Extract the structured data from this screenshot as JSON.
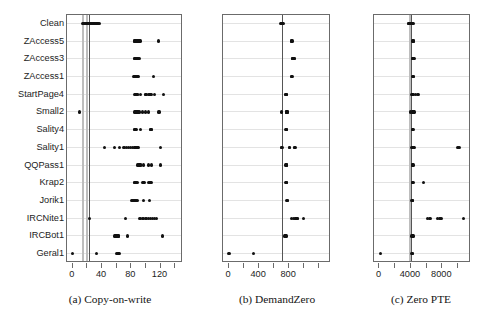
{
  "figure": {
    "type": "multi-panel-strip-plot",
    "panel_count": 3,
    "shared_categories": [
      "Clean",
      "ZAccess5",
      "ZAccess3",
      "ZAccess1",
      "StartPage4",
      "Small2",
      "Sality4",
      "Sality1",
      "QQPass1",
      "Krap2",
      "Jorik1",
      "IRCNite1",
      "IRCBot1",
      "Geral1"
    ],
    "colors": {
      "point": "#111111",
      "box_border": "#6b6b6b",
      "gridline": "#e3e3e3",
      "reference_line_dark": "#555555",
      "reference_line_light": "#bdbdbd",
      "background": "#ffffff"
    }
  },
  "chart_data": [
    {
      "type": "scatter",
      "panel_id": "a",
      "title": "(a) Copy-on-write",
      "caption_prefix": "(a)",
      "caption_name": "Copy-on-write",
      "xlabel": "",
      "ylabel": "",
      "xlim": [
        -8,
        148
      ],
      "grid": true,
      "legend": false,
      "tick_values": [
        0,
        20,
        40,
        60,
        80,
        100,
        120,
        140
      ],
      "tick_labels": [
        "0",
        "",
        "40",
        "",
        "80",
        "",
        "120",
        ""
      ],
      "reference_lines": [
        {
          "value": 13,
          "style": "light"
        },
        {
          "value": 18,
          "style": "light"
        },
        {
          "value": 22,
          "style": "dark"
        }
      ],
      "categories": [
        "Clean",
        "ZAccess5",
        "ZAccess3",
        "ZAccess1",
        "StartPage4",
        "Small2",
        "Sality4",
        "Sality1",
        "QQPass1",
        "Krap2",
        "Jorik1",
        "IRCNite1",
        "IRCBot1",
        "Geral1"
      ],
      "series": [
        {
          "name": "Clean",
          "values": [
            14,
            15,
            16,
            17,
            18,
            19,
            20,
            21,
            22,
            23,
            24,
            25,
            26,
            27,
            28,
            29,
            30,
            31,
            32,
            33,
            34,
            35,
            36
          ]
        },
        {
          "name": "ZAccess5",
          "values": [
            84,
            85,
            86,
            87,
            88,
            89,
            90,
            91,
            92,
            117
          ]
        },
        {
          "name": "ZAccess3",
          "values": [
            84,
            85,
            86,
            87,
            88,
            89,
            90,
            91
          ]
        },
        {
          "name": "ZAccess1",
          "values": [
            83,
            84,
            85,
            86,
            87,
            88,
            89,
            90,
            110
          ]
        },
        {
          "name": "StartPage4",
          "values": [
            85,
            86,
            87,
            88,
            89,
            93,
            99,
            100,
            104,
            105,
            106,
            107,
            112,
            124
          ]
        },
        {
          "name": "Small2",
          "values": [
            9,
            85,
            86,
            87,
            88,
            89,
            90,
            91,
            95,
            99,
            103,
            118
          ]
        },
        {
          "name": "Sality4",
          "values": [
            84,
            85,
            86,
            87,
            93,
            106,
            107,
            108
          ]
        },
        {
          "name": "Sality1",
          "values": [
            43,
            57,
            64,
            70,
            73,
            76,
            79,
            82,
            84,
            85,
            86,
            87,
            88,
            89,
            90,
            120
          ]
        },
        {
          "name": "QQPass1",
          "values": [
            89,
            90,
            91,
            92,
            93,
            97,
            103,
            108,
            120
          ]
        },
        {
          "name": "Krap2",
          "values": [
            84,
            85,
            86,
            87,
            88,
            96,
            97,
            98,
            104,
            105,
            106,
            107
          ]
        },
        {
          "name": "Jorik1",
          "values": [
            81,
            82,
            83,
            84,
            85,
            86,
            87,
            88,
            97,
            105
          ]
        },
        {
          "name": "IRCNite1",
          "values": [
            23,
            72,
            92,
            96,
            100,
            103,
            106,
            109,
            112,
            115
          ]
        },
        {
          "name": "IRCBot1",
          "values": [
            57,
            58,
            59,
            60,
            61,
            62,
            63,
            75,
            123
          ]
        },
        {
          "name": "Geral1",
          "values": [
            0,
            32,
            60,
            61,
            62,
            63,
            64
          ]
        }
      ]
    },
    {
      "type": "scatter",
      "panel_id": "b",
      "title": "(b) DemandZero",
      "caption_prefix": "(b)",
      "caption_name": "DemandZero",
      "xlabel": "",
      "ylabel": "",
      "xlim": [
        -80,
        1330
      ],
      "grid": true,
      "legend": false,
      "tick_values": [
        0,
        200,
        400,
        600,
        800,
        1000,
        1200
      ],
      "tick_labels": [
        "0",
        "",
        "400",
        "",
        "800",
        "",
        ""
      ],
      "reference_lines": [
        {
          "value": 700,
          "style": "dark"
        }
      ],
      "categories": [
        "Clean",
        "ZAccess5",
        "ZAccess3",
        "ZAccess1",
        "StartPage4",
        "Small2",
        "Sality4",
        "Sality1",
        "QQPass1",
        "Krap2",
        "Jorik1",
        "IRCNite1",
        "IRCBot1",
        "Geral1"
      ],
      "series": [
        {
          "name": "Clean",
          "values": [
            690,
            695,
            700,
            705,
            710,
            715,
            720
          ]
        },
        {
          "name": "ZAccess5",
          "values": [
            830,
            835,
            840
          ]
        },
        {
          "name": "ZAccess3",
          "values": [
            840,
            845,
            850,
            855,
            860,
            865,
            870
          ]
        },
        {
          "name": "ZAccess1",
          "values": [
            830,
            835,
            840
          ]
        },
        {
          "name": "StartPage4",
          "values": [
            750,
            755,
            760,
            765,
            770
          ]
        },
        {
          "name": "Small2",
          "values": [
            700,
            760,
            765,
            770,
            775,
            780
          ]
        },
        {
          "name": "Sality4",
          "values": [
            755,
            760,
            765,
            770
          ]
        },
        {
          "name": "Sality1",
          "values": [
            700,
            705,
            800,
            805,
            870,
            875,
            880
          ]
        },
        {
          "name": "QQPass1",
          "values": [
            755,
            760,
            765,
            770
          ]
        },
        {
          "name": "Krap2",
          "values": [
            755,
            760,
            765,
            770
          ]
        },
        {
          "name": "Jorik1",
          "values": [
            770,
            775,
            780
          ]
        },
        {
          "name": "IRCNite1",
          "values": [
            830,
            860,
            880,
            885,
            890,
            900,
            905,
            910,
            990
          ]
        },
        {
          "name": "IRCBot1",
          "values": [
            745,
            750,
            755,
            760
          ]
        },
        {
          "name": "Geral1",
          "values": [
            0,
            330
          ]
        }
      ]
    },
    {
      "type": "scatter",
      "panel_id": "c",
      "title": "(c) Zero PTE",
      "caption_prefix": "(c)",
      "caption_name": "Zero PTE",
      "xlabel": "",
      "ylabel": "",
      "xlim": [
        -700,
        11400
      ],
      "grid": true,
      "legend": false,
      "tick_values": [
        0,
        2000,
        4000,
        6000,
        8000,
        10000
      ],
      "tick_labels": [
        "0",
        "",
        "4000",
        "",
        "8000",
        ""
      ],
      "reference_lines": [
        {
          "value": 3750,
          "style": "light"
        },
        {
          "value": 3950,
          "style": "dark"
        }
      ],
      "categories": [
        "Clean",
        "ZAccess5",
        "ZAccess3",
        "ZAccess1",
        "StartPage4",
        "Small2",
        "Sality4",
        "Sality1",
        "QQPass1",
        "Krap2",
        "Jorik1",
        "IRCNite1",
        "IRCBot1",
        "Geral1"
      ],
      "series": [
        {
          "name": "Clean",
          "values": [
            3650,
            3750,
            3850,
            3950,
            4050,
            4150,
            4250,
            4350
          ]
        },
        {
          "name": "ZAccess5",
          "values": [
            4250,
            4300,
            4350
          ]
        },
        {
          "name": "ZAccess3",
          "values": [
            4200,
            4250,
            4300,
            4350,
            4400
          ]
        },
        {
          "name": "ZAccess1",
          "values": [
            4250,
            4300,
            4350
          ]
        },
        {
          "name": "StartPage4",
          "values": [
            4150,
            4200,
            4250,
            4300,
            4600,
            4900
          ]
        },
        {
          "name": "Small2",
          "values": [
            3900,
            4200,
            4250,
            4300,
            4350,
            4400
          ]
        },
        {
          "name": "Sality4",
          "values": [
            4200,
            4250,
            4300
          ]
        },
        {
          "name": "Sality1",
          "values": [
            4150,
            4200,
            4250,
            4300,
            4350,
            4400,
            9900,
            10050,
            10150
          ]
        },
        {
          "name": "QQPass1",
          "values": [
            4200,
            4250,
            4300
          ]
        },
        {
          "name": "Krap2",
          "values": [
            4200,
            4250,
            4300,
            5600
          ]
        },
        {
          "name": "Jorik1",
          "values": [
            4150,
            4200,
            4250
          ]
        },
        {
          "name": "IRCNite1",
          "values": [
            6100,
            6400,
            6500,
            7400,
            7700,
            7900,
            10700
          ]
        },
        {
          "name": "IRCBot1",
          "values": [
            4150,
            4200,
            4250,
            4300
          ]
        },
        {
          "name": "Geral1",
          "values": [
            100,
            4150,
            4200
          ]
        }
      ]
    }
  ]
}
